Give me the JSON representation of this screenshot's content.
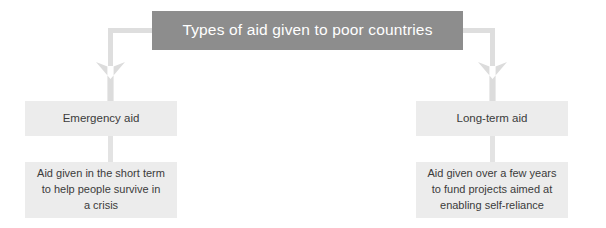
{
  "diagram": {
    "type": "flowchart",
    "orientation": "top-down",
    "title_node": {
      "label": "Types of aid given to poor countries",
      "background_color": "#8d8d8d",
      "text_color": "#ffffff"
    },
    "branches": [
      {
        "id": "emergency",
        "label": "Emergency aid",
        "background_color": "#ececec",
        "text_color": "#3b3b3b",
        "detail": {
          "label": "Aid given in the short term\nto help people survive in\na crisis",
          "background_color": "#ececec",
          "text_color": "#3b3b3b"
        }
      },
      {
        "id": "long-term",
        "label": "Long-term aid",
        "background_color": "#ececec",
        "text_color": "#3b3b3b",
        "detail": {
          "label": "Aid given over a few years\nto fund projects aimed at\nenabling self-reliance",
          "background_color": "#ececec",
          "text_color": "#3b3b3b"
        }
      }
    ],
    "connectors": {
      "elbow_color": "#dedede",
      "arrow_color": "#dcdcdc",
      "stem_color": "#e3e3e3"
    }
  }
}
